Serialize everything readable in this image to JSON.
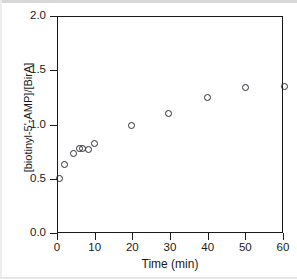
{
  "chart_data": {
    "type": "scatter",
    "title": "",
    "xlabel": "Time (min)",
    "ylabel": "[biotinyl-5'-AMP]/[BirA]",
    "xlim": [
      0,
      60
    ],
    "ylim": [
      0.0,
      2.0
    ],
    "xticks": [
      0,
      10,
      20,
      30,
      40,
      50,
      60
    ],
    "xtick_labels": [
      "0",
      "10",
      "20",
      "30",
      "40",
      "50",
      "60"
    ],
    "yticks": [
      0.0,
      0.5,
      1.0,
      1.5,
      2.0
    ],
    "ytick_labels": [
      "0.0",
      "0.5",
      "1.0",
      "1.5",
      "2.0"
    ],
    "grid": false,
    "legend": null,
    "marker": "open-circle",
    "marker_color": "#2b2b34",
    "series": [
      {
        "name": "biotinyl-5'-AMP per BirA",
        "x": [
          0.3,
          1.6,
          4.0,
          5.6,
          6.6,
          8.2,
          9.8,
          19.4,
          29.4,
          39.8,
          49.9,
          60.0
        ],
        "y": [
          0.51,
          0.64,
          0.74,
          0.79,
          0.79,
          0.78,
          0.83,
          1.0,
          1.11,
          1.26,
          1.35,
          1.36
        ]
      }
    ]
  },
  "figure": {
    "background_color": "#ffffff",
    "axis_color": "#1a1a1a"
  }
}
